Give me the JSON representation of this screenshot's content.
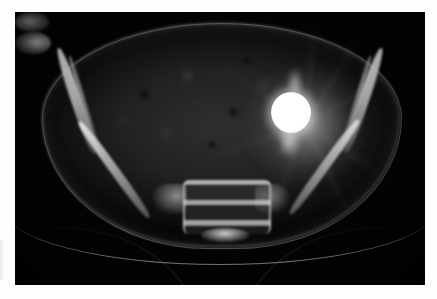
{
  "image": {
    "modality": "CT",
    "plane": "axial",
    "anatomy": "pelvis",
    "caption": "",
    "background_color": "#000000",
    "frame_color": "#fdfdfd",
    "canvas": {
      "width": 437,
      "height": 299
    },
    "scan_area": {
      "x": 15,
      "y": 12,
      "width": 410,
      "height": 273
    }
  },
  "findings": {
    "soft_tissue_label": "pelvic soft tissue",
    "bowel_label": "bowel gas and mesenteric fat",
    "skin_label": "skin contour",
    "ilium_left_label": "left iliac wing",
    "ilium_right_label": "right iliac wing",
    "sacrum_label": "sacrum",
    "coccyx_label": "coccygeal segment",
    "metal_label": "hyperdense spherical foreign body",
    "streak_label": "metallic streak artifact",
    "table_label": "scanner table"
  },
  "colors": {
    "bone_bright": "#f0f0f0",
    "bone_mid": "#c8c8c8",
    "soft_tissue": "#2e2e2e",
    "metal": "#ffffff",
    "background": "#000000",
    "frame": "#fdfdfd",
    "table_line": "#afafaf"
  }
}
